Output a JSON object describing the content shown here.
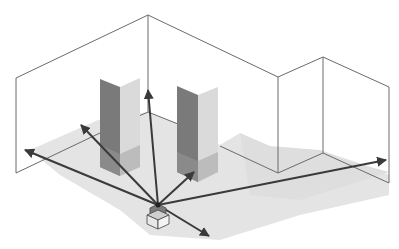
{
  "diagram": {
    "description": "Isometric room with two pillars and a central sensor emitting rays to walls",
    "colors": {
      "background": "#ffffff",
      "wall_line": "#6a6a6a",
      "floor_shadow": "#e2e2e2",
      "pillar_dark": "#7a7a7a",
      "pillar_dark_lower": "#8c8c8c",
      "pillar_light": "#dadada",
      "pillar_light_lower": "#bdbdbd",
      "ray": "#3a3a3a",
      "sensor_top": "#9a9a9a",
      "sensor_box": "#e8e8e8"
    },
    "elements": {
      "walls": "room-walls",
      "pillars": [
        "pillar-left",
        "pillar-right"
      ],
      "sensor": "sensor-device",
      "rays": [
        "ray-far-left",
        "ray-left",
        "ray-up",
        "ray-right-pillar",
        "ray-right",
        "ray-down-right"
      ]
    }
  }
}
